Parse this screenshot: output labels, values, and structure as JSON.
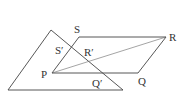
{
  "diagram": {
    "type": "geometry",
    "stroke_color": "#444444",
    "triangle": {
      "apex": [
        51,
        30
      ],
      "bottom_left": [
        8,
        90
      ],
      "bottom_right": [
        123,
        90
      ]
    },
    "parallelogram": {
      "P": [
        52,
        73
      ],
      "Q": [
        138,
        73
      ],
      "R": [
        166,
        37
      ],
      "S": [
        79,
        37
      ]
    },
    "diagonal": {
      "from": "P",
      "to": "R"
    },
    "labels": {
      "S": "S",
      "R": "R",
      "P": "P",
      "Q": "Q",
      "S_prime": "S′",
      "R_prime": "R′",
      "Q_prime": "Q′"
    }
  }
}
